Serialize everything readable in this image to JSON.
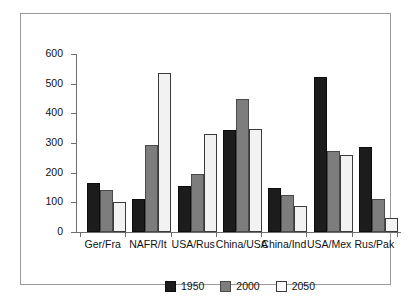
{
  "chart_data": {
    "type": "bar",
    "title": "",
    "xlabel": "",
    "ylabel": "",
    "ylim": [
      0,
      600
    ],
    "yticks": [
      0,
      100,
      200,
      300,
      400,
      500,
      600
    ],
    "grid": false,
    "legend_position": "bottom",
    "categories": [
      "Ger/Fra",
      "NAFR/It",
      "USA/Rus",
      "China/USA",
      "China/Ind",
      "USA/Mex",
      "Rus/Pak"
    ],
    "series": [
      {
        "name": "1950",
        "color": "#1c1c1c",
        "values": [
          165,
          110,
          155,
          343,
          148,
          522,
          285
        ]
      },
      {
        "name": "2000",
        "color": "#7d7d7d",
        "values": [
          140,
          293,
          195,
          450,
          125,
          272,
          112
        ]
      },
      {
        "name": "2050",
        "color": "#f2f2f2",
        "values": [
          100,
          535,
          330,
          348,
          88,
          258,
          47
        ]
      }
    ]
  },
  "axis": {
    "y_tick_labels": [
      "600",
      "500",
      "400",
      "300",
      "200",
      "100",
      "0"
    ]
  },
  "legend": {
    "items": [
      {
        "label": "1950"
      },
      {
        "label": "2000"
      },
      {
        "label": "2050"
      }
    ]
  }
}
